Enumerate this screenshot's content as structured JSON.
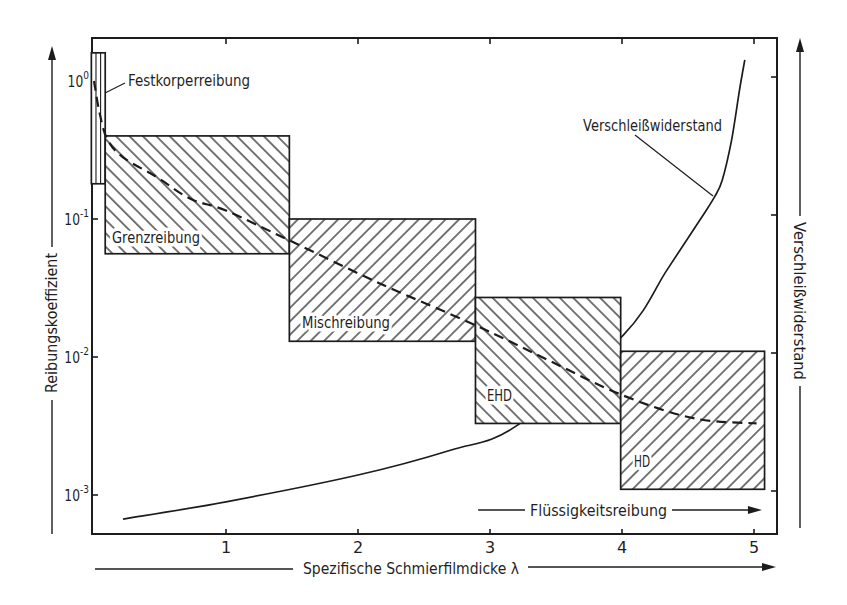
{
  "chart_data": {
    "type": "line",
    "title": "",
    "xlabel": "Spezifische Schmierfilmdicke λ",
    "ylabel": "Reibungskoeffizient",
    "ylabel_right": "Verschleißwiderstand",
    "x_scale": "linear",
    "xlim": [
      0,
      5.2
    ],
    "x_ticks": [
      1,
      2,
      3,
      4,
      5
    ],
    "x_tick_labels": [
      "1",
      "2",
      "3",
      "4",
      "5"
    ],
    "y_scale": "log",
    "ylim": [
      0.0007,
      2.0
    ],
    "y_ticks": [
      1,
      0.1,
      0.01,
      0.001
    ],
    "y_tick_labels": [
      {
        "base": "10",
        "exp": "0"
      },
      {
        "base": "10",
        "exp": "-1"
      },
      {
        "base": "10",
        "exp": "-2"
      },
      {
        "base": "10",
        "exp": "-3"
      }
    ],
    "y_right_scale": "relative",
    "y_right_ticks": [
      1,
      0.1,
      0.01,
      0.001
    ],
    "grid": false,
    "legend": null,
    "regions": [
      {
        "id": "festkoerperreibung",
        "label": "Festkorperreibung",
        "x": [
          -0.02,
          0.085
        ],
        "y": [
          0.18,
          1.6
        ],
        "hatch": "vertical"
      },
      {
        "id": "grenzreibung",
        "label": "Grenzreibung",
        "x": [
          0.085,
          1.48
        ],
        "y": [
          0.056,
          0.4
        ],
        "hatch": "backslash"
      },
      {
        "id": "mischreibung",
        "label": "Mischreibung",
        "x": [
          1.48,
          2.89
        ],
        "y": [
          0.013,
          0.1
        ],
        "hatch": "slash"
      },
      {
        "id": "ehd",
        "label": "EHD",
        "x": [
          2.89,
          3.99
        ],
        "y": [
          0.0033,
          0.027
        ],
        "hatch": "backslash"
      },
      {
        "id": "hd",
        "label": "HD",
        "x": [
          3.99,
          5.08
        ],
        "y": [
          0.0011,
          0.011
        ],
        "hatch": "slash"
      }
    ],
    "series": [
      {
        "name": "Reibungskoeffizient",
        "axis": "left",
        "style": "dashed",
        "points": [
          [
            0.0,
            1.0
          ],
          [
            0.04,
            0.6
          ],
          [
            0.1,
            0.38
          ],
          [
            0.22,
            0.28
          ],
          [
            0.48,
            0.2
          ],
          [
            0.73,
            0.14
          ],
          [
            1.0,
            0.115
          ],
          [
            1.48,
            0.07
          ],
          [
            2.17,
            0.034
          ],
          [
            2.89,
            0.017
          ],
          [
            3.44,
            0.0095
          ],
          [
            4.0,
            0.0053
          ],
          [
            4.54,
            0.0036
          ],
          [
            5.02,
            0.0033
          ]
        ]
      },
      {
        "name": "Verschleißwiderstand",
        "axis": "right",
        "style": "solid",
        "points": [
          [
            0.22,
            0.03
          ],
          [
            1.0,
            0.065
          ],
          [
            2.0,
            0.119
          ],
          [
            2.7,
            0.169
          ],
          [
            3.2,
            0.218
          ],
          [
            4.01,
            0.401
          ],
          [
            4.34,
            0.532
          ],
          [
            4.59,
            0.633
          ],
          [
            4.7,
            0.679
          ],
          [
            4.76,
            0.714
          ],
          [
            4.83,
            0.794
          ],
          [
            4.89,
            0.895
          ],
          [
            4.93,
            0.956
          ]
        ]
      }
    ],
    "annotations": [
      {
        "text": "Flüssigkeitsreibung",
        "type": "range-arrow",
        "x": [
          2.91,
          5.06
        ]
      }
    ]
  }
}
